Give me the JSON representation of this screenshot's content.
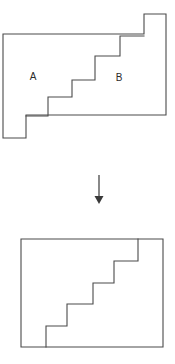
{
  "figure": {
    "canvas": {
      "width": 175,
      "height": 364,
      "background": "#ffffff"
    },
    "stroke_color": "#4a4a4a",
    "arrow_color": "#3a3a3a",
    "label_color": "#2b2b2b",
    "top_shape": {
      "name": "stepped-polygon-cut-into-two-pieces",
      "outline_points": "3,34 144,34 144,14 166,14 166,115 26,115 26,138 3,138",
      "cut_path": "M 26,116 L 48,116 L 48,97 L 72,97 L 72,80 L 95,80 L 95,56 L 120,56 L 120,36 L 144,36",
      "labels": [
        {
          "text": "A",
          "x": 33,
          "y": 77,
          "name": "piece-a-label"
        },
        {
          "text": "B",
          "x": 119,
          "y": 78,
          "name": "piece-b-label"
        }
      ]
    },
    "arrow": {
      "name": "transformation-arrow",
      "direction": "down",
      "x": 99,
      "y_start": 175,
      "y_end": 196,
      "head_half_width": 4.5,
      "head_tip_y": 204
    },
    "bottom_shape": {
      "name": "rearranged-rectangle",
      "outline_points": "21,239 163,239 163,347 21,347",
      "cut_path": "M 46,347 L 46,326 L 67,326 L 67,304 L 93,304 L 93,283 L 114,283 L 114,261 L 138,261 L 138,239"
    }
  }
}
